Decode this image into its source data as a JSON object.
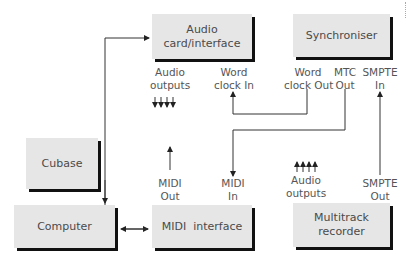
{
  "boxes": {
    "audio_card": "Audio card/interface",
    "synchroniser": "Synchroniser",
    "cubase": "Cubase",
    "computer": "Computer",
    "midi_interface": "MIDI  interface",
    "multitrack": "Multitrack recorder"
  },
  "labels": {
    "audio_outputs_top_1": "Audio",
    "audio_outputs_top_2": "outputs",
    "word_clock_in_1": "Word",
    "word_clock_in_2": "clock In",
    "word_clock_out_1": "Word",
    "word_clock_out_2": "clock Out",
    "mtc_out_1": "MTC",
    "mtc_out_2": "Out",
    "smpte_in_1": "SMPTE",
    "smpte_in_2": "In",
    "midi_out_1": "MIDI",
    "midi_out_2": "Out",
    "midi_in_1": "MIDI",
    "midi_in_2": "In",
    "audio_outputs_bottom_1": "Audio",
    "audio_outputs_bottom_2": "outputs",
    "smpte_out_1": "SMPTE",
    "smpte_out_2": "Out"
  },
  "connections": [
    {
      "from": "Computer",
      "to": "Audio card/interface"
    },
    {
      "from": "Computer",
      "to": "MIDI interface",
      "bidirectional": true
    },
    {
      "from": "Synchroniser Word clock Out",
      "to": "Audio card/interface Word clock In"
    },
    {
      "from": "Synchroniser MTC Out",
      "to": "MIDI interface MIDI In"
    },
    {
      "from": "Multitrack recorder SMPTE Out",
      "to": "Synchroniser SMPTE In"
    },
    {
      "from": "MIDI interface MIDI Out",
      "to": "up"
    },
    {
      "from": "Audio card/interface",
      "to": "Audio outputs (4)"
    },
    {
      "from": "Multitrack recorder",
      "to": "Audio outputs (4)"
    }
  ]
}
